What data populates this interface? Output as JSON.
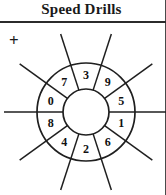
{
  "worksheet": {
    "title": "Speed Drills",
    "operator": "+",
    "operator_name": "plus-sign"
  },
  "wheel": {
    "center_x": 86,
    "center_y": 88,
    "inner_radius": 23,
    "outer_radius": 49,
    "spoke_outer_radius": 82,
    "segment_count": 10,
    "segments": [
      {
        "digit": "3",
        "angle_deg": -90
      },
      {
        "digit": "9",
        "angle_deg": -54
      },
      {
        "digit": "5",
        "angle_deg": -18
      },
      {
        "digit": "1",
        "angle_deg": 18
      },
      {
        "digit": "6",
        "angle_deg": 54
      },
      {
        "digit": "2",
        "angle_deg": 90
      },
      {
        "digit": "4",
        "angle_deg": 126
      },
      {
        "digit": "8",
        "angle_deg": 162
      },
      {
        "digit": "0",
        "angle_deg": 198
      },
      {
        "digit": "7",
        "angle_deg": 234
      }
    ],
    "divider_angles_deg": [
      -72,
      -36,
      0,
      36,
      72,
      108,
      144,
      180,
      216,
      252
    ]
  },
  "colors": {
    "ink": "#1f1f1f",
    "rule": "#2b2b2b",
    "border": "#4a4a4a",
    "paper": "#ffffff"
  }
}
